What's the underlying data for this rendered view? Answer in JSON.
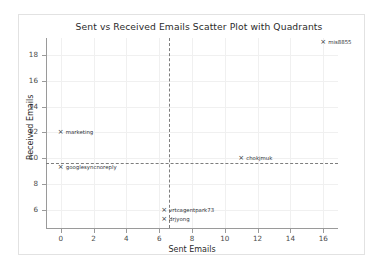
{
  "chart_data": {
    "type": "scatter",
    "title": "Sent vs Received Emails Scatter Plot with Quadrants",
    "xlabel": "Sent Emails",
    "ylabel": "Received Emails",
    "xlim": [
      -0.9,
      16.9
    ],
    "ylim": [
      4.6,
      19.3
    ],
    "xticks": [
      0,
      2,
      4,
      6,
      8,
      10,
      12,
      14,
      16
    ],
    "yticks": [
      6,
      8,
      10,
      12,
      14,
      16,
      18
    ],
    "grid": true,
    "legend": "none",
    "marker": "x",
    "marker_color": "#30343a",
    "quadrant_lines": {
      "vline_x": 6.6,
      "hline_y": 9.6,
      "style": "dashed",
      "color": "#7d7d7d"
    },
    "points": [
      {
        "label": "mis8855",
        "x": 16.0,
        "y": 19.0
      },
      {
        "label": "marketing",
        "x": 0.0,
        "y": 12.0
      },
      {
        "label": "chokjmuk",
        "x": 11.0,
        "y": 10.0
      },
      {
        "label": "googlesyncnoreply",
        "x": 0.0,
        "y": 9.3
      },
      {
        "label": "vrtcagentpark73",
        "x": 6.3,
        "y": 6.0
      },
      {
        "label": "drjyong",
        "x": 6.3,
        "y": 5.3
      }
    ]
  }
}
